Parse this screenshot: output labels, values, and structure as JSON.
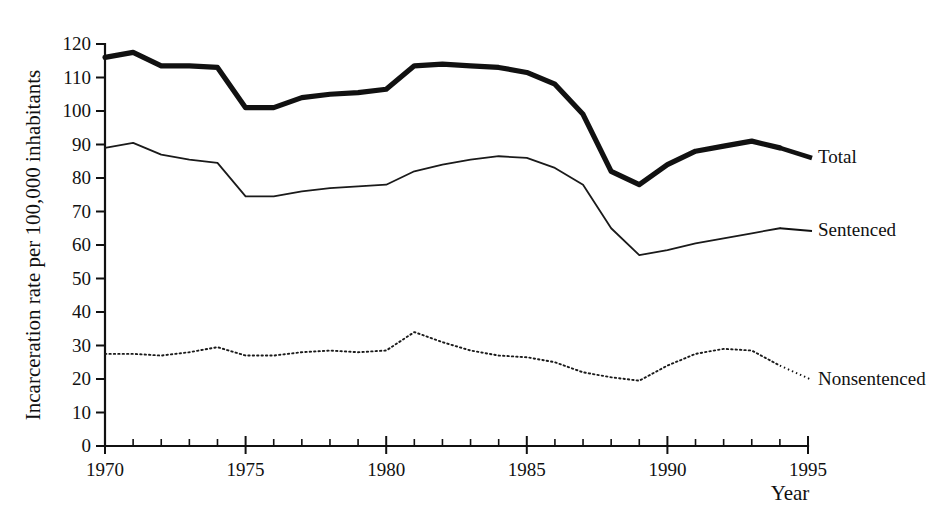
{
  "chart_data": {
    "type": "line",
    "title": "",
    "xlabel": "Year",
    "ylabel": "Incarceration rate per 100,000 inhabitants",
    "xlim": [
      1970,
      1995
    ],
    "ylim": [
      0,
      120
    ],
    "grid": false,
    "legend_position": "right-inline-labels",
    "y_ticks": [
      0,
      10,
      20,
      30,
      40,
      50,
      60,
      70,
      80,
      90,
      100,
      110,
      120
    ],
    "y_tick_labels": [
      "0",
      "10",
      "20",
      "30",
      "40",
      "50",
      "60",
      "70",
      "80",
      "90",
      "100",
      "110",
      "120"
    ],
    "x_ticks": [
      1970,
      1975,
      1980,
      1985,
      1990,
      1995
    ],
    "x_tick_labels": [
      "1970",
      "1975",
      "1980",
      "1985",
      "1990",
      "1995"
    ],
    "x_minor_tick_step": 1,
    "x": [
      1970,
      1971,
      1972,
      1973,
      1974,
      1975,
      1976,
      1977,
      1978,
      1979,
      1980,
      1981,
      1982,
      1983,
      1984,
      1985,
      1986,
      1987,
      1988,
      1989,
      1990,
      1991,
      1992,
      1993,
      1994
    ],
    "series": [
      {
        "name": "Total",
        "style": "thick-solid",
        "color": "#111111",
        "values": [
          116,
          117.5,
          113.5,
          113.5,
          113,
          101,
          101,
          104,
          105,
          105.5,
          106.5,
          113.5,
          114,
          113.5,
          113,
          111.5,
          108,
          99,
          82,
          78,
          84,
          88,
          89.5,
          91,
          89
        ]
      },
      {
        "name": "Sentenced",
        "style": "thin-solid",
        "color": "#1a1a1a",
        "values": [
          89,
          90.5,
          87,
          85.5,
          84.5,
          74.5,
          74.5,
          76,
          77,
          77.5,
          78,
          82,
          84,
          85.5,
          86.5,
          86,
          83,
          78,
          65,
          57,
          58.5,
          60.5,
          62,
          63.5,
          65
        ]
      },
      {
        "name": "Nonsentenced",
        "style": "dotted",
        "color": "#1a1a1a",
        "values": [
          27.5,
          27.5,
          27,
          28,
          29.5,
          27,
          27,
          28,
          28.5,
          28,
          28.5,
          34,
          31,
          28.5,
          27,
          26.5,
          25,
          22,
          20.5,
          19.5,
          24,
          27.5,
          29,
          28.5,
          24
        ]
      }
    ]
  },
  "series_labels": [
    {
      "text": "Total"
    },
    {
      "text": "Sentenced"
    },
    {
      "text": "Nonsentenced"
    }
  ],
  "axis": {
    "x_title": "Year",
    "y_title": "Incarceration rate per 100,000 inhabitants"
  }
}
